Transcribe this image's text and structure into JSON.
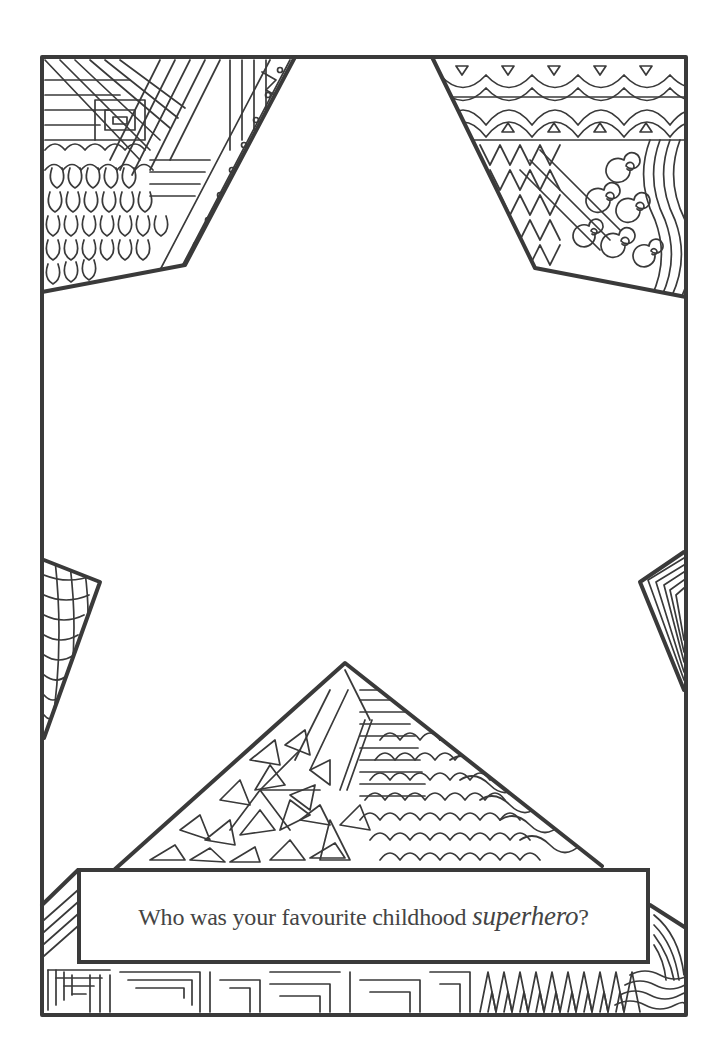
{
  "page": {
    "type": "colouring-journal-page",
    "background": "#ffffff",
    "ink_color": "#3a3a3a",
    "frame_shape": "rectangle with central white star cut-out",
    "regions": [
      {
        "name": "top-left-corner",
        "pattern": "spiral-stripes, petals, zigzag-dots"
      },
      {
        "name": "top-right-corner",
        "pattern": "scallop-bands, zigzag-chevrons, swirls, waves"
      },
      {
        "name": "left-point",
        "pattern": "wavy-net"
      },
      {
        "name": "right-point",
        "pattern": "nested-triangles"
      },
      {
        "name": "bottom-triangle",
        "pattern": "triangle-shards, ladders, fish-scales, waves"
      },
      {
        "name": "bottom-border",
        "pattern": "maze-squares, zigzag, waves"
      }
    ]
  },
  "prompt": {
    "text_before": "Who was your favourite childhood ",
    "text_emphasis": "superhero",
    "text_after": "?"
  }
}
